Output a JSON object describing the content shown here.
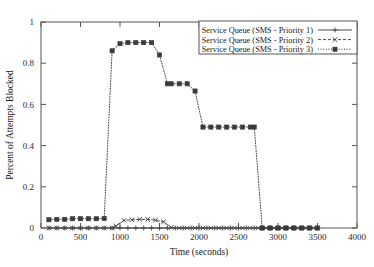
{
  "chart_data": {
    "type": "line",
    "title": "",
    "xlabel": "Time (seconds)",
    "ylabel": "Percent of Attempts Blocked",
    "xlim": [
      0,
      4000
    ],
    "ylim": [
      0,
      1
    ],
    "xticks": [
      0,
      500,
      1000,
      1500,
      2000,
      2500,
      3000,
      3500,
      4000
    ],
    "xtick_labels": [
      "0",
      "500",
      "1000",
      "1500",
      "2000",
      "2500",
      "3000",
      "3500",
      "4000"
    ],
    "yticks": [
      0,
      0.2,
      0.4,
      0.6,
      0.8,
      1
    ],
    "ytick_labels": [
      "0",
      "0.2",
      "0.4",
      "0.6",
      "0.8",
      "1"
    ],
    "grid": false,
    "legend_position": "top-right",
    "series": [
      {
        "name": "Service Queue (SMS - Priority 1)",
        "line_style": "solid",
        "marker": "plus",
        "color": "#4a4a4a",
        "x": [
          100,
          200,
          300,
          400,
          500,
          600,
          700,
          800,
          900,
          1000,
          1100,
          1200,
          1300,
          1400,
          1500,
          1600,
          1700,
          1800,
          1900,
          2000,
          2100,
          2200,
          2300,
          2400,
          2500,
          2600,
          2700,
          2800,
          2900,
          3000,
          3100,
          3200,
          3300,
          3400,
          3500
        ],
        "values": [
          0,
          0,
          0,
          0,
          0,
          0,
          0,
          0,
          0,
          0,
          0,
          0,
          0,
          0,
          0,
          0,
          0,
          0,
          0,
          0,
          0,
          0,
          0,
          0,
          0,
          0,
          0,
          0,
          0,
          0,
          0,
          0,
          0,
          0,
          0
        ]
      },
      {
        "name": "Service Queue (SMS - Priority 2)",
        "line_style": "dashed",
        "marker": "cross",
        "color": "#4a4a4a",
        "x": [
          100,
          200,
          300,
          400,
          500,
          600,
          700,
          800,
          900,
          950,
          1050,
          1150,
          1250,
          1350,
          1450,
          1550,
          1650,
          1750,
          1850,
          1950,
          2050,
          2150,
          2250,
          2350,
          2450,
          2550,
          2650,
          2750,
          2850,
          2950,
          3050,
          3150,
          3250,
          3350,
          3450,
          3500
        ],
        "values": [
          0,
          0,
          0,
          0,
          0,
          0,
          0,
          0,
          0,
          0.01,
          0.037,
          0.04,
          0.042,
          0.042,
          0.038,
          0.03,
          0.003,
          0,
          0,
          0,
          0,
          0,
          0,
          0,
          0,
          0,
          0,
          0,
          0,
          0,
          0,
          0,
          0,
          0,
          0,
          0
        ]
      },
      {
        "name": "Service Queue (SMS - Priority 3)",
        "line_style": "dotted",
        "marker": "filled-square",
        "color": "#3a3a3a",
        "x": [
          100,
          200,
          300,
          400,
          500,
          600,
          700,
          800,
          900,
          1000,
          1100,
          1200,
          1300,
          1400,
          1500,
          1600,
          1650,
          1750,
          1850,
          1950,
          2050,
          2150,
          2250,
          2350,
          2450,
          2550,
          2650,
          2700,
          2800,
          2900,
          3000,
          3100,
          3200,
          3300,
          3400,
          3500
        ],
        "values": [
          0.04,
          0.042,
          0.042,
          0.045,
          0.045,
          0.045,
          0.045,
          0.046,
          0.86,
          0.895,
          0.9,
          0.9,
          0.9,
          0.9,
          0.84,
          0.7,
          0.7,
          0.7,
          0.7,
          0.665,
          0.49,
          0.49,
          0.49,
          0.49,
          0.49,
          0.49,
          0.49,
          0.49,
          0,
          0,
          0,
          0,
          0,
          0,
          0,
          0
        ]
      }
    ]
  },
  "legend": {
    "entries": [
      {
        "label": "Service Queue (SMS - Priority 1)"
      },
      {
        "label": "Service Queue (SMS - Priority 2)"
      },
      {
        "label": "Service Queue (SMS - Priority 3)"
      }
    ]
  }
}
